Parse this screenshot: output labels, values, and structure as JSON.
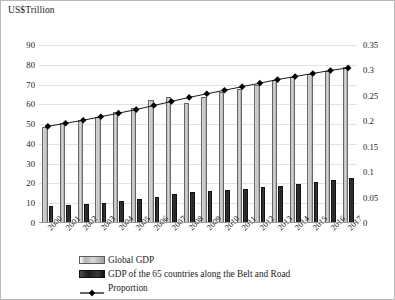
{
  "axis_unit_label": "US$Trillion",
  "legend": {
    "items": [
      {
        "key": "gdp-bar",
        "label": "Global GDP"
      },
      {
        "key": "brc-bar",
        "label": "GDP of the 65 countries along the Belt and Road"
      },
      {
        "key": "proportion-line",
        "label": "Proportion"
      }
    ]
  },
  "colors": {
    "gdp_bar": "#c0c0c0",
    "brc_bar": "#1c1c1c",
    "line": "#000000",
    "gridline": "#e2e2e2",
    "frame": "#b9b9b9"
  },
  "chart_data": {
    "type": "bar",
    "title": "",
    "subtitle": "",
    "xlabel": "",
    "ylabel": "US$Trillion",
    "y2label": "",
    "grid": true,
    "legend_position": "bottom",
    "ylim": [
      0,
      90
    ],
    "ytick_step": 10,
    "yticks": [
      0,
      10,
      20,
      30,
      40,
      50,
      60,
      70,
      80,
      90
    ],
    "y2lim": [
      0,
      0.35
    ],
    "y2tick_step": 0.05,
    "y2ticks": [
      "0",
      "0.05",
      "0.1",
      "0.15",
      "0.2",
      "0.25",
      "0.3",
      "0.35"
    ],
    "categories": [
      "2000",
      "2001",
      "2002",
      "2003",
      "2004",
      "2005",
      "2006",
      "2007",
      "2008",
      "2009",
      "2010",
      "2011",
      "2012",
      "2013",
      "2014",
      "2015",
      "2016",
      "2017"
    ],
    "series": [
      {
        "name": "Global GDP",
        "type": "bar",
        "axis": "left",
        "values": [
          48.6,
          50.5,
          52.0,
          53.6,
          56.3,
          58.4,
          62.0,
          63.8,
          60.5,
          63.8,
          66.0,
          68.0,
          70.0,
          72.5,
          74.0,
          75.5,
          77.0,
          79.0
        ]
      },
      {
        "name": "GDP of the 65 countries along the Belt and Road",
        "type": "bar",
        "axis": "left",
        "values": [
          8.6,
          9.0,
          9.6,
          10.3,
          11.3,
          12.2,
          13.3,
          14.6,
          15.7,
          16.2,
          16.5,
          17.4,
          18.0,
          18.6,
          19.6,
          20.6,
          21.5,
          23.0
        ]
      },
      {
        "name": "Proportion",
        "type": "line",
        "axis": "right",
        "marker": "diamond",
        "values": [
          0.19,
          0.196,
          0.202,
          0.209,
          0.216,
          0.223,
          0.231,
          0.239,
          0.247,
          0.254,
          0.261,
          0.268,
          0.275,
          0.282,
          0.288,
          0.294,
          0.3,
          0.305
        ]
      }
    ]
  }
}
